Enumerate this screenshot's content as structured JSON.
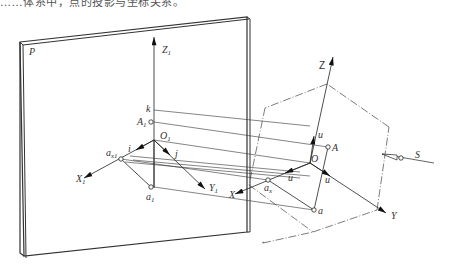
{
  "caption_fragment": "……体系中，点的投影与坐标关系。",
  "diagram": {
    "type": "axonometric projection diagram",
    "plane_label": "P",
    "labels": {
      "Z1": {
        "main": "Z",
        "sub": "1"
      },
      "k": {
        "main": "k"
      },
      "A1": {
        "main": "A",
        "sub": "1"
      },
      "O1": {
        "main": "O",
        "sub": "1"
      },
      "ax1": {
        "main": "a",
        "sub": "x1"
      },
      "i": {
        "main": "i"
      },
      "j": {
        "main": "j"
      },
      "X1": {
        "main": "X",
        "sub": "1"
      },
      "Y1": {
        "main": "Y",
        "sub": "1"
      },
      "a1": {
        "main": "a",
        "sub": "1"
      },
      "Z": {
        "main": "Z"
      },
      "u_z": {
        "main": "u"
      },
      "A": {
        "main": "A"
      },
      "O": {
        "main": "O"
      },
      "u_x": {
        "main": "u"
      },
      "u_y": {
        "main": "u"
      },
      "ax": {
        "main": "a",
        "sub": "x"
      },
      "X": {
        "main": "X"
      },
      "a": {
        "main": "a"
      },
      "Y": {
        "main": "Y"
      },
      "S": {
        "main": "S"
      }
    },
    "colors": {
      "line": "#222222",
      "plane_edge": "#333333",
      "label": "#333333"
    }
  }
}
